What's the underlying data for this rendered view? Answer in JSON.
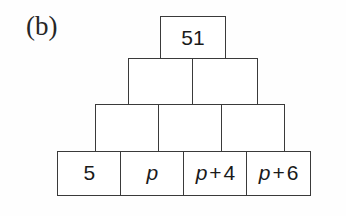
{
  "figure": {
    "panel_label": "(b)",
    "type": "addition-pyramid",
    "row_count": 4
  },
  "pyramid": {
    "rows": [
      {
        "level": 1,
        "cells": [
          {
            "text": "51",
            "kind": "number",
            "variable": "",
            "operator": "",
            "constant": "51"
          }
        ]
      },
      {
        "level": 2,
        "cells": [
          {
            "text": "",
            "kind": "empty",
            "variable": "",
            "operator": "",
            "constant": ""
          },
          {
            "text": "",
            "kind": "empty",
            "variable": "",
            "operator": "",
            "constant": ""
          }
        ]
      },
      {
        "level": 3,
        "cells": [
          {
            "text": "",
            "kind": "empty",
            "variable": "",
            "operator": "",
            "constant": ""
          },
          {
            "text": "",
            "kind": "empty",
            "variable": "",
            "operator": "",
            "constant": ""
          },
          {
            "text": "",
            "kind": "empty",
            "variable": "",
            "operator": "",
            "constant": ""
          }
        ]
      },
      {
        "level": 4,
        "cells": [
          {
            "text": "5",
            "kind": "number",
            "variable": "",
            "operator": "",
            "constant": "5"
          },
          {
            "text": "p",
            "kind": "variable",
            "variable": "p",
            "operator": "",
            "constant": ""
          },
          {
            "text": "p + 4",
            "kind": "expression",
            "variable": "p",
            "operator": "+",
            "constant": "4"
          },
          {
            "text": "p + 6",
            "kind": "expression",
            "variable": "p",
            "operator": "+",
            "constant": "6"
          }
        ]
      }
    ]
  },
  "colors": {
    "background": "#fefefe",
    "box_border": "#3a3a3a",
    "box_fill": "#ffffff",
    "text": "#1a1a1a",
    "label_text": "#262626"
  }
}
